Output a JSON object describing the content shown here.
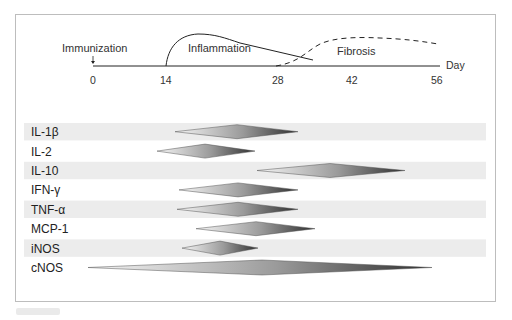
{
  "timeline": {
    "axis_label": "Day",
    "ticks": [
      {
        "value": "0",
        "x": 93
      },
      {
        "value": "14",
        "x": 166
      },
      {
        "value": "28",
        "x": 278
      },
      {
        "value": "42",
        "x": 352
      },
      {
        "value": "56",
        "x": 437
      }
    ],
    "events": {
      "immunization": "Immunization",
      "inflammation": "Inflammation",
      "fibrosis": "Fibrosis"
    }
  },
  "rows": [
    {
      "label": "IL-1β",
      "start": 175,
      "peak": 237,
      "end": 298,
      "shaded": true
    },
    {
      "label": "IL-2",
      "start": 157,
      "peak": 205,
      "end": 255,
      "shaded": false
    },
    {
      "label": "IL-10",
      "start": 257,
      "peak": 330,
      "end": 405,
      "shaded": true
    },
    {
      "label": "IFN-γ",
      "start": 179,
      "peak": 238,
      "end": 298,
      "shaded": false
    },
    {
      "label": "TNF-α",
      "start": 177,
      "peak": 238,
      "end": 298,
      "shaded": true
    },
    {
      "label": "MCP-1",
      "start": 196,
      "peak": 256,
      "end": 315,
      "shaded": false
    },
    {
      "label": "iNOS",
      "start": 182,
      "peak": 220,
      "end": 258,
      "shaded": true
    },
    {
      "label": "cNOS",
      "start": 88,
      "peak": 262,
      "end": 432,
      "shaded": false
    }
  ],
  "colors": {
    "band": "#ececec",
    "diamond_light": "#f4f4f4",
    "diamond_dark": "#3a3a3a",
    "line": "#222222"
  }
}
